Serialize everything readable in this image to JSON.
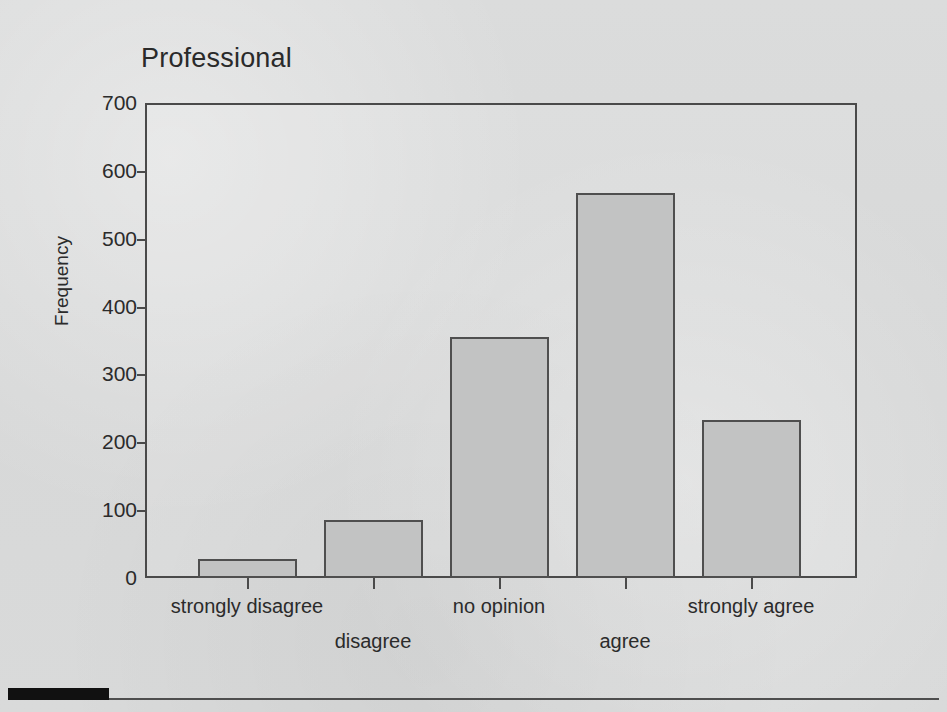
{
  "figure": {
    "title": "Professional",
    "background_color": "#d9dada",
    "bar_fill_color": "#c2c3c3",
    "bar_edge_color": "#4f4f4f",
    "axis_color": "#4a4a4a",
    "text_color": "#2b2b2b"
  },
  "axes": {
    "ylabel": "Frequency",
    "xlabel": "",
    "yticks": [
      "0",
      "100",
      "200",
      "300",
      "400",
      "500",
      "600",
      "700"
    ]
  },
  "chart_data": {
    "type": "bar",
    "title": "Professional",
    "xlabel": "",
    "ylabel": "Frequency",
    "categories": [
      "strongly disagree",
      "disagree",
      "no opinion",
      "agree",
      "strongly agree"
    ],
    "values": [
      28,
      85,
      355,
      567,
      233
    ],
    "ylim": [
      0,
      700
    ],
    "ytick_values": [
      0,
      100,
      200,
      300,
      400,
      500,
      600,
      700
    ],
    "grid": false,
    "legend": null
  }
}
